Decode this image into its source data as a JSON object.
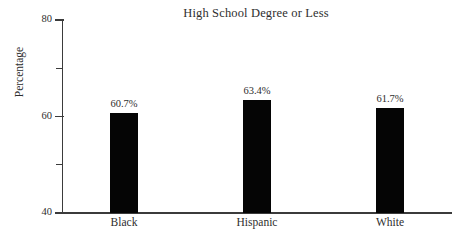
{
  "chart_data": {
    "type": "bar",
    "title": "High School Degree or Less",
    "xlabel": "",
    "ylabel": "Percentage",
    "categories": [
      "Black",
      "Hispanic",
      "White"
    ],
    "values": [
      60.7,
      63.4,
      61.7
    ],
    "value_labels": [
      "60.7%",
      "63.4%",
      "61.7%"
    ],
    "ylim": [
      40,
      80
    ],
    "ytick_values": [
      80,
      70,
      60,
      50,
      40
    ],
    "ytick_labels": [
      "80",
      "",
      "60",
      "",
      "40"
    ],
    "ytick_labels_all": [
      "80",
      "70",
      "60",
      "50",
      "40"
    ],
    "grid": false,
    "legend": false,
    "legend_position": "none",
    "bar_color": "#050505",
    "axis_color": "#3b3b3b",
    "text_color": "#2e2e2e",
    "background": "#ffffff",
    "labeled_ticks": [
      "80",
      "60",
      "40"
    ]
  },
  "axis": {
    "y_top_label": "80",
    "y_mid_label": "60",
    "y_bottom_label": "40"
  },
  "bars": [
    {
      "category": "Black",
      "value_label": "60.7%"
    },
    {
      "category": "Hispanic",
      "value_label": "63.4%"
    },
    {
      "category": "White",
      "value_label": "61.7%"
    }
  ]
}
